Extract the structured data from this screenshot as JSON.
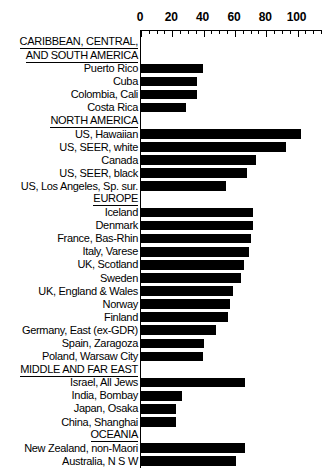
{
  "chart_data": {
    "type": "bar",
    "orientation": "horizontal",
    "title": "",
    "xlabel": "",
    "ylabel": "",
    "xlim": [
      0,
      115
    ],
    "grid": false,
    "legend": null,
    "xticks": [
      0,
      20,
      40,
      60,
      80,
      100
    ],
    "xtick_labels": [
      "0",
      "20",
      "40",
      "60",
      "80",
      "100"
    ],
    "minor_tick_step": 5,
    "bar_color": "#000000",
    "groups": [
      {
        "header": [
          "CARIBBEAN, CENTRAL,",
          "AND SOUTH AMERICA"
        ],
        "categories": [
          "Puerto Rico",
          "Cuba",
          "Colombia, Cali",
          "Costa Rica"
        ],
        "values": [
          39.5,
          36.0,
          36.0,
          28.5
        ]
      },
      {
        "header": [
          "NORTH AMERICA"
        ],
        "categories": [
          "US, Hawaiian",
          "US, SEER, white",
          "Canada",
          "US, SEER, black",
          "US, Los Angeles, Sp. sur."
        ],
        "values": [
          102.0,
          92.5,
          73.5,
          67.5,
          54.0
        ]
      },
      {
        "header": [
          "EUROPE"
        ],
        "categories": [
          "Iceland",
          "Denmark",
          "France, Bas-Rhin",
          "Italy, Varese",
          "UK, Scotland",
          "Sweden",
          "UK, England & Wales",
          "Norway",
          "Finland",
          "Germany, East (ex-GDR)",
          "Spain, Zaragoza",
          "Poland, Warsaw City"
        ],
        "values": [
          71.5,
          71.5,
          70.0,
          69.0,
          65.5,
          64.0,
          58.5,
          57.0,
          55.5,
          48.0,
          40.5,
          39.5
        ]
      },
      {
        "header": [
          "MIDDLE AND FAR EAST"
        ],
        "categories": [
          "Israel, All Jews",
          "India, Bombay",
          "Japan, Osaka",
          "China, Shanghai"
        ],
        "values": [
          66.5,
          26.0,
          22.5,
          22.5
        ]
      },
      {
        "header": [
          "OCEANIA"
        ],
        "categories": [
          "New Zealand, non-Maori",
          "Australia, N S W"
        ],
        "values": [
          66.5,
          61.0
        ]
      }
    ]
  }
}
